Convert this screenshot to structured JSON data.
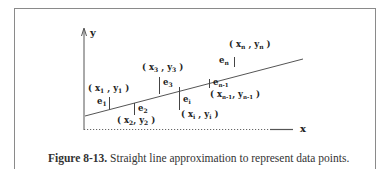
{
  "figure": {
    "caption_number": "Figure 8-13.",
    "caption_text": " Straight line approximation to represent data points.",
    "axes": {
      "x_label": "x",
      "y_label": "y"
    },
    "points": [
      {
        "label": "(x1, y1)",
        "x_sub": "1",
        "y_sub": "1",
        "error": "e1",
        "error_sub": "1"
      },
      {
        "label": "(x2, y2)",
        "x_sub": "2",
        "y_sub": "2",
        "error": "e2",
        "error_sub": "2"
      },
      {
        "label": "(x3, y3)",
        "x_sub": "3",
        "y_sub": "3",
        "error": "e3",
        "error_sub": "3"
      },
      {
        "label": "(xi, yi)",
        "x_sub": "i",
        "y_sub": "i",
        "error": "ei",
        "error_sub": "i"
      },
      {
        "label": "(xn-1, yn-1)",
        "x_sub": "n-1",
        "y_sub": "n-1",
        "error": "en-1",
        "error_sub": "n-1"
      },
      {
        "label": "(xn, yn)",
        "x_sub": "n",
        "y_sub": "n",
        "error": "en",
        "error_sub": "n"
      }
    ],
    "colors": {
      "line": "#555555",
      "frame": "#8a8a8a",
      "text": "#222222"
    }
  }
}
